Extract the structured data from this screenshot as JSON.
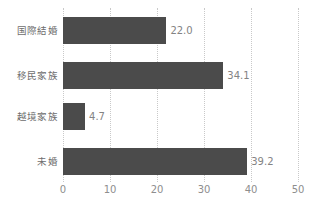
{
  "chart_data": {
    "type": "bar",
    "orientation": "horizontal",
    "title": "",
    "xlabel": "",
    "ylabel": "",
    "categories": [
      "国際結婚",
      "移民家族",
      "越境家族",
      "未婚"
    ],
    "values": [
      22.0,
      34.1,
      4.7,
      39.2
    ],
    "value_labels": [
      "22.0",
      "34.1",
      "4.7",
      "39.2"
    ],
    "xlim": [
      0,
      50
    ],
    "xticks": [
      0,
      10,
      20,
      30,
      40,
      50
    ],
    "xtick_labels": [
      "0",
      "10",
      "20",
      "30",
      "40",
      "50"
    ],
    "grid": "vertical-dotted",
    "legend": "none",
    "bar_color": "#4b4b4b",
    "grid_color": "#c9c9c9",
    "label_color": "#6d6d6d",
    "value_color": "#838383",
    "tick_color": "#8e8e8e",
    "background": "#ffffff"
  }
}
